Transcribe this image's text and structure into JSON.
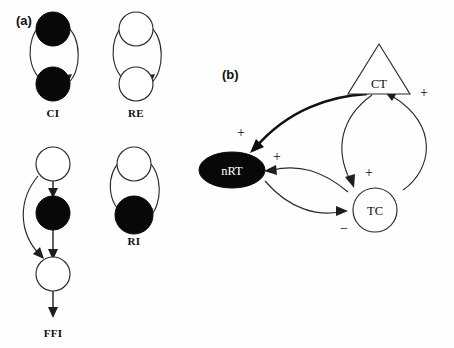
{
  "figure": {
    "panels": [
      {
        "id": "a",
        "label": "(a)",
        "caption_role": "network-motifs",
        "motifs": [
          {
            "name": "CI",
            "label": "CI",
            "description": "two filled (inhibitory) nodes with reciprocal connections",
            "nodes": [
              {
                "id": "ci-top",
                "fill": "filled",
                "shape": "circle"
              },
              {
                "id": "ci-bottom",
                "fill": "filled",
                "shape": "circle"
              }
            ],
            "edges": [
              {
                "from": "ci-top",
                "to": "ci-bottom",
                "style": "curved",
                "sign": ""
              },
              {
                "from": "ci-bottom",
                "to": "ci-top",
                "style": "curved",
                "sign": ""
              }
            ]
          },
          {
            "name": "RE",
            "label": "RE",
            "description": "two open (excitatory) nodes with reciprocal connections",
            "nodes": [
              {
                "id": "re-top",
                "fill": "open",
                "shape": "circle"
              },
              {
                "id": "re-bottom",
                "fill": "open",
                "shape": "circle"
              }
            ],
            "edges": [
              {
                "from": "re-top",
                "to": "re-bottom",
                "style": "curved",
                "sign": ""
              },
              {
                "from": "re-bottom",
                "to": "re-top",
                "style": "curved",
                "sign": ""
              }
            ]
          },
          {
            "name": "FFI",
            "label": "FFI",
            "description": "feed-forward inhibition: open source node drives a filled node and an open target node directly",
            "nodes": [
              {
                "id": "ffi-top",
                "fill": "open",
                "shape": "circle"
              },
              {
                "id": "ffi-mid",
                "fill": "filled",
                "shape": "circle"
              },
              {
                "id": "ffi-bottom",
                "fill": "open",
                "shape": "circle"
              }
            ],
            "edges": [
              {
                "from": "ffi-top",
                "to": "ffi-mid",
                "style": "straight",
                "sign": ""
              },
              {
                "from": "ffi-mid",
                "to": "ffi-bottom",
                "style": "straight",
                "sign": ""
              },
              {
                "from": "ffi-top",
                "to": "ffi-bottom",
                "style": "curved-bypass",
                "sign": ""
              },
              {
                "from": "ffi-bottom",
                "to": "output",
                "style": "straight",
                "sign": ""
              }
            ]
          },
          {
            "name": "RI",
            "label": "RI",
            "description": "recurrent inhibition: open node and filled node with reciprocal connections",
            "nodes": [
              {
                "id": "ri-top",
                "fill": "open",
                "shape": "circle"
              },
              {
                "id": "ri-bottom",
                "fill": "filled",
                "shape": "circle"
              }
            ],
            "edges": [
              {
                "from": "ri-top",
                "to": "ri-bottom",
                "style": "curved",
                "sign": ""
              },
              {
                "from": "ri-bottom",
                "to": "ri-top",
                "style": "curved",
                "sign": ""
              }
            ]
          }
        ]
      },
      {
        "id": "b",
        "label": "(b)",
        "caption_role": "thalamocortical-circuit",
        "nodes": [
          {
            "id": "CT",
            "label": "CT",
            "shape": "triangle",
            "fill": "open",
            "text_color": "dark"
          },
          {
            "id": "nRT",
            "label": "nRT",
            "shape": "ellipse",
            "fill": "filled",
            "text_color": "white"
          },
          {
            "id": "TC",
            "label": "TC",
            "shape": "circle",
            "fill": "open",
            "text_color": "dark"
          }
        ],
        "edges": [
          {
            "from": "CT",
            "to": "nRT",
            "sign": "+",
            "style": "thick-curve"
          },
          {
            "from": "CT",
            "to": "TC",
            "sign": "+",
            "style": "curve"
          },
          {
            "from": "TC",
            "to": "CT",
            "sign": "+",
            "style": "curve"
          },
          {
            "from": "TC",
            "to": "nRT",
            "sign": "+",
            "style": "curve"
          },
          {
            "from": "nRT",
            "to": "TC",
            "sign": "−",
            "style": "curve"
          }
        ],
        "signs": {
          "ct_to_nrt": "+",
          "ct_to_tc": "+",
          "tc_to_ct": "+",
          "tc_to_nrt": "+",
          "nrt_to_tc": "−"
        }
      }
    ],
    "colors": {
      "background": "#fefefe",
      "ink": "#1d1d1d",
      "filled_node": "#080808",
      "open_node_fill": "#ffffff",
      "open_node_stroke": "#2a2a2a"
    }
  }
}
